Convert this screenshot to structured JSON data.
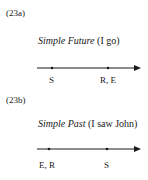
{
  "diagrams": [
    {
      "id": "(23a)",
      "title_italic": "Simple Future",
      "title_rest": " (I go)",
      "timeline": {
        "points": [
          {
            "label": "S",
            "x": 52
          },
          {
            "label": "R, E",
            "x": 108
          }
        ]
      }
    },
    {
      "id": "(23b)",
      "title_italic": "Simple Past",
      "title_rest": " (I saw John)",
      "timeline": {
        "points": [
          {
            "label": "E, R",
            "x": 49
          },
          {
            "label": "S",
            "x": 107
          }
        ]
      }
    }
  ]
}
